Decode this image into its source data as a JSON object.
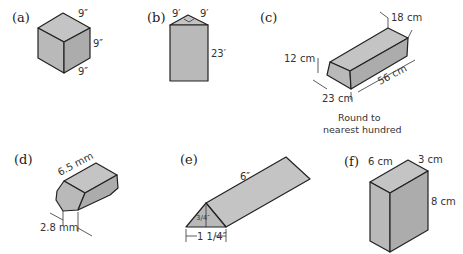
{
  "figures": {
    "a": {
      "label": "(a)",
      "shape": "cube",
      "dims": [
        "9″",
        "9″",
        "9″"
      ]
    },
    "b": {
      "label": "(b)",
      "shape": "triangular-prism-top",
      "dims": [
        "9′",
        "9′",
        "23′"
      ]
    },
    "c": {
      "label": "(c)",
      "shape": "trapezoidal-prism",
      "dims": {
        "top": "18 cm",
        "height": "12 cm",
        "bottom": "23 cm",
        "length": "56 cm"
      },
      "note_line1": "Round to",
      "note_line2": "nearest hundred"
    },
    "d": {
      "label": "(d)",
      "shape": "hexagonal-prism",
      "dims": {
        "length": "6.5 mm",
        "side": "2.8 mm"
      }
    },
    "e": {
      "label": "(e)",
      "shape": "triangular-prism",
      "dims": {
        "length": "6″",
        "height": "3/4″",
        "base": "1 1/4″"
      }
    },
    "f": {
      "label": "(f)",
      "shape": "rectangular-box",
      "dims": {
        "width": "6 cm",
        "depth": "3 cm",
        "height": "8 cm"
      }
    }
  }
}
